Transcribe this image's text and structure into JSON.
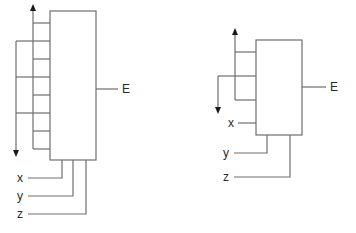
{
  "diagrams": [
    {
      "id": "left",
      "output_label": "E",
      "inputs": [
        {
          "label": "x"
        },
        {
          "label": "y"
        },
        {
          "label": "z"
        }
      ]
    },
    {
      "id": "right",
      "output_label": "E",
      "inputs": [
        {
          "label": "x"
        },
        {
          "label": "y"
        },
        {
          "label": "z"
        }
      ]
    }
  ],
  "colors": {
    "line": "#6e6e6e",
    "arrow": "#1a1a1a",
    "text": "#2a2a2a",
    "background": "#ffffff"
  }
}
